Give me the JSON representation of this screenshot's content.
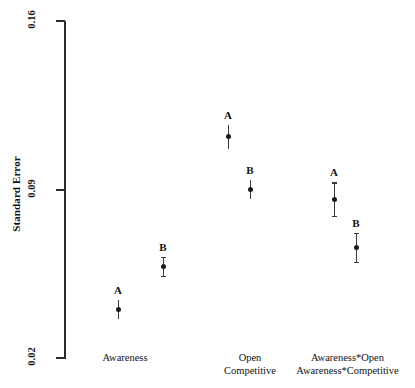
{
  "chart_data": {
    "type": "scatter",
    "title": "",
    "xlabel": "",
    "ylabel": "Standard Error",
    "ylim": [
      0.02,
      0.16
    ],
    "ytick_labels": [
      "0.16",
      "0.09",
      "0.02"
    ],
    "ytick_values": [
      0.16,
      0.09,
      0.02
    ],
    "grid": false,
    "legend": null,
    "categories": [
      "Awareness",
      "Open Competitive",
      "Awareness*Open Awareness*Competitive"
    ],
    "category_lines": [
      [
        "Awareness"
      ],
      [
        "Open",
        "Competitive"
      ],
      [
        "Awareness*Open",
        "Awareness*Competitive"
      ]
    ],
    "series": [
      {
        "name": "A",
        "values": [
          0.04,
          0.112,
          0.086
        ],
        "errors": [
          0.004,
          0.005,
          0.007
        ]
      },
      {
        "name": "B",
        "values": [
          0.058,
          0.09,
          0.066
        ],
        "errors": [
          0.004,
          0.004,
          0.006
        ]
      }
    ],
    "points": [
      {
        "label": "A",
        "group": "Awareness",
        "value": 0.04,
        "error": 0.004,
        "caps": false
      },
      {
        "label": "B",
        "group": "Awareness",
        "value": 0.058,
        "error": 0.004,
        "caps": true
      },
      {
        "label": "A",
        "group": "Open Competitive",
        "value": 0.112,
        "error": 0.005,
        "caps": false
      },
      {
        "label": "B",
        "group": "Open Competitive",
        "value": 0.09,
        "error": 0.004,
        "caps": false
      },
      {
        "label": "A",
        "group": "Awareness*Open Awareness*Competitive",
        "value": 0.086,
        "error": 0.007,
        "caps": true
      },
      {
        "label": "B",
        "group": "Awareness*Open Awareness*Competitive",
        "value": 0.066,
        "error": 0.006,
        "caps": true
      }
    ]
  },
  "axes": {
    "y_title": "Standard Error",
    "y_ticks": [
      {
        "label": "0.16",
        "value": 0.16
      },
      {
        "label": "0.09",
        "value": 0.09
      },
      {
        "label": "0.02",
        "value": 0.02
      }
    ]
  },
  "x_groups": [
    {
      "lines": [
        "Awareness"
      ]
    },
    {
      "lines": [
        "Open",
        "Competitive"
      ]
    },
    {
      "lines": [
        "Awareness*Open",
        "Awareness*Competitive"
      ]
    }
  ]
}
